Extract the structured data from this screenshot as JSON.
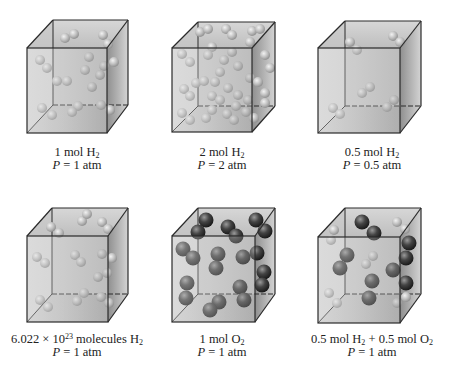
{
  "figure": {
    "colors": {
      "background": "#ffffff",
      "edge": "#2a2a2a",
      "h2_molecule": "#b8b8b8",
      "o2_molecule": "#3a3a3a"
    },
    "panels": [
      {
        "id": "p1",
        "amount": "1 mol H",
        "amount_sub": "2",
        "pressure_var": "P",
        "pressure_rest": " = 1 atm",
        "cube": {
          "bx": 53,
          "by": 20,
          "fx": 27,
          "fy": 48,
          "w": 80,
          "h": 85,
          "bw": 75
        },
        "molecules": [
          {
            "type": "H2",
            "x": 65,
            "y": 38
          },
          {
            "type": "H2",
            "x": 74,
            "y": 34
          },
          {
            "type": "H2",
            "x": 103,
            "y": 35
          },
          {
            "type": "H2",
            "x": 108,
            "y": 44
          },
          {
            "type": "H2",
            "x": 40,
            "y": 60
          },
          {
            "type": "H2",
            "x": 47,
            "y": 68
          },
          {
            "type": "H2",
            "x": 89,
            "y": 57
          },
          {
            "type": "H2",
            "x": 85,
            "y": 70
          },
          {
            "type": "H2",
            "x": 104,
            "y": 66
          },
          {
            "type": "H2",
            "x": 114,
            "y": 62
          },
          {
            "type": "H2",
            "x": 57,
            "y": 81
          },
          {
            "type": "H2",
            "x": 67,
            "y": 81
          },
          {
            "type": "H2",
            "x": 100,
            "y": 75
          },
          {
            "type": "H2",
            "x": 92,
            "y": 87
          },
          {
            "type": "H2",
            "x": 42,
            "y": 108
          },
          {
            "type": "H2",
            "x": 52,
            "y": 115
          },
          {
            "type": "H2",
            "x": 78,
            "y": 106
          },
          {
            "type": "H2",
            "x": 72,
            "y": 112
          },
          {
            "type": "H2",
            "x": 101,
            "y": 105
          },
          {
            "type": "H2",
            "x": 110,
            "y": 110
          }
        ]
      },
      {
        "id": "p2",
        "amount": "2 mol H",
        "amount_sub": "2",
        "pressure_var": "P",
        "pressure_rest": " = 2 atm",
        "cube": {
          "bx": 198,
          "by": 22,
          "fx": 172,
          "fy": 48,
          "w": 80,
          "h": 84,
          "bw": 77
        },
        "molecules": [
          {
            "type": "H2",
            "x": 200,
            "y": 32
          },
          {
            "type": "H2",
            "x": 208,
            "y": 29
          },
          {
            "type": "H2",
            "x": 226,
            "y": 29
          },
          {
            "type": "H2",
            "x": 232,
            "y": 35
          },
          {
            "type": "H2",
            "x": 252,
            "y": 31
          },
          {
            "type": "H2",
            "x": 260,
            "y": 29
          },
          {
            "type": "H2",
            "x": 212,
            "y": 47
          },
          {
            "type": "H2",
            "x": 250,
            "y": 42
          },
          {
            "type": "H2",
            "x": 182,
            "y": 54
          },
          {
            "type": "H2",
            "x": 190,
            "y": 62
          },
          {
            "type": "H2",
            "x": 208,
            "y": 55
          },
          {
            "type": "H2",
            "x": 224,
            "y": 60
          },
          {
            "type": "H2",
            "x": 232,
            "y": 52
          },
          {
            "type": "H2",
            "x": 265,
            "y": 55
          },
          {
            "type": "H2",
            "x": 270,
            "y": 68
          },
          {
            "type": "H2",
            "x": 220,
            "y": 72
          },
          {
            "type": "H2",
            "x": 238,
            "y": 66
          },
          {
            "type": "H2",
            "x": 250,
            "y": 78
          },
          {
            "type": "H2",
            "x": 196,
            "y": 83
          },
          {
            "type": "H2",
            "x": 204,
            "y": 81
          },
          {
            "type": "H2",
            "x": 215,
            "y": 82
          },
          {
            "type": "H2",
            "x": 228,
            "y": 88
          },
          {
            "type": "H2",
            "x": 258,
            "y": 82
          },
          {
            "type": "H2",
            "x": 265,
            "y": 93
          },
          {
            "type": "H2",
            "x": 184,
            "y": 89
          },
          {
            "type": "H2",
            "x": 190,
            "y": 96
          },
          {
            "type": "H2",
            "x": 212,
            "y": 96
          },
          {
            "type": "H2",
            "x": 220,
            "y": 100
          },
          {
            "type": "H2",
            "x": 238,
            "y": 95
          },
          {
            "type": "H2",
            "x": 248,
            "y": 100
          },
          {
            "type": "H2",
            "x": 265,
            "y": 103
          },
          {
            "type": "H2",
            "x": 182,
            "y": 113
          },
          {
            "type": "H2",
            "x": 190,
            "y": 120
          },
          {
            "type": "H2",
            "x": 212,
            "y": 110
          },
          {
            "type": "H2",
            "x": 206,
            "y": 118
          },
          {
            "type": "H2",
            "x": 227,
            "y": 114
          },
          {
            "type": "H2",
            "x": 234,
            "y": 120
          },
          {
            "type": "H2",
            "x": 246,
            "y": 112
          },
          {
            "type": "H2",
            "x": 254,
            "y": 118
          },
          {
            "type": "H2",
            "x": 236,
            "y": 106
          }
        ]
      },
      {
        "id": "p3",
        "amount": "0.5 mol H",
        "amount_sub": "2",
        "pressure_var": "P",
        "pressure_rest": " = 0.5 atm",
        "cube": {
          "bx": 345,
          "by": 21,
          "fx": 318,
          "fy": 48,
          "w": 82,
          "h": 85,
          "bw": 76
        },
        "molecules": [
          {
            "type": "H2",
            "x": 350,
            "y": 42
          },
          {
            "type": "H2",
            "x": 357,
            "y": 50
          },
          {
            "type": "H2",
            "x": 393,
            "y": 36
          },
          {
            "type": "H2",
            "x": 400,
            "y": 42
          },
          {
            "type": "H2",
            "x": 370,
            "y": 87
          },
          {
            "type": "H2",
            "x": 362,
            "y": 93
          },
          {
            "type": "H2",
            "x": 333,
            "y": 108
          },
          {
            "type": "H2",
            "x": 340,
            "y": 114
          },
          {
            "type": "H2",
            "x": 394,
            "y": 100
          },
          {
            "type": "H2",
            "x": 387,
            "y": 107
          }
        ]
      },
      {
        "id": "p4",
        "amount_pre": "6.022 × 10",
        "amount_sup": "23",
        "amount": " molecules H",
        "amount_sub": "2",
        "pressure_var": "P",
        "pressure_rest": " = 1 atm",
        "cube": {
          "bx": 52,
          "by": 208,
          "fx": 27,
          "fy": 236,
          "w": 81,
          "h": 86,
          "bw": 76
        },
        "molecules": [
          {
            "type": "H2",
            "x": 51,
            "y": 227
          },
          {
            "type": "H2",
            "x": 59,
            "y": 233
          },
          {
            "type": "H2",
            "x": 82,
            "y": 221
          },
          {
            "type": "H2",
            "x": 87,
            "y": 214
          },
          {
            "type": "H2",
            "x": 102,
            "y": 222
          },
          {
            "type": "H2",
            "x": 108,
            "y": 229
          },
          {
            "type": "H2",
            "x": 37,
            "y": 257
          },
          {
            "type": "H2",
            "x": 45,
            "y": 263
          },
          {
            "type": "H2",
            "x": 75,
            "y": 255
          },
          {
            "type": "H2",
            "x": 81,
            "y": 262
          },
          {
            "type": "H2",
            "x": 102,
            "y": 254
          },
          {
            "type": "H2",
            "x": 112,
            "y": 258
          },
          {
            "type": "H2",
            "x": 107,
            "y": 273
          },
          {
            "type": "H2",
            "x": 98,
            "y": 277
          },
          {
            "type": "H2",
            "x": 40,
            "y": 300
          },
          {
            "type": "H2",
            "x": 48,
            "y": 307
          },
          {
            "type": "H2",
            "x": 84,
            "y": 293
          },
          {
            "type": "H2",
            "x": 77,
            "y": 301
          },
          {
            "type": "H2",
            "x": 101,
            "y": 297
          },
          {
            "type": "H2",
            "x": 109,
            "y": 303
          }
        ]
      },
      {
        "id": "p5",
        "amount": "1 mol O",
        "amount_sub": "2",
        "pressure_var": "P",
        "pressure_rest": " = 1 atm",
        "cube": {
          "bx": 198,
          "by": 208,
          "fx": 172,
          "fy": 236,
          "w": 83,
          "h": 86,
          "bw": 77
        },
        "molecules": [
          {
            "type": "O2",
            "x": 206,
            "y": 220
          },
          {
            "type": "O2",
            "x": 198,
            "y": 232
          },
          {
            "type": "O2",
            "x": 228,
            "y": 227
          },
          {
            "type": "O2",
            "x": 236,
            "y": 236
          },
          {
            "type": "O2",
            "x": 256,
            "y": 220
          },
          {
            "type": "O2",
            "x": 265,
            "y": 231
          },
          {
            "type": "O2",
            "x": 183,
            "y": 249
          },
          {
            "type": "O2",
            "x": 193,
            "y": 258
          },
          {
            "type": "O2",
            "x": 218,
            "y": 254
          },
          {
            "type": "O2",
            "x": 216,
            "y": 268
          },
          {
            "type": "O2",
            "x": 243,
            "y": 257
          },
          {
            "type": "O2",
            "x": 257,
            "y": 253
          },
          {
            "type": "O2",
            "x": 264,
            "y": 272
          },
          {
            "type": "O2",
            "x": 262,
            "y": 285
          },
          {
            "type": "O2",
            "x": 187,
            "y": 283
          },
          {
            "type": "O2",
            "x": 186,
            "y": 298
          },
          {
            "type": "O2",
            "x": 219,
            "y": 302
          },
          {
            "type": "O2",
            "x": 210,
            "y": 310
          },
          {
            "type": "O2",
            "x": 240,
            "y": 287
          },
          {
            "type": "O2",
            "x": 244,
            "y": 300
          }
        ]
      },
      {
        "id": "p6",
        "amount": "0.5 mol H",
        "amount_sub": "2",
        "amount_mid": " + 0.5 mol O",
        "amount_sub2": "2",
        "pressure_var": "P",
        "pressure_rest": " = 1 atm",
        "cube": {
          "bx": 345,
          "by": 208,
          "fx": 318,
          "fy": 237,
          "w": 82,
          "h": 86,
          "bw": 76
        },
        "molecules": [
          {
            "type": "H2",
            "x": 334,
            "y": 230
          },
          {
            "type": "H2",
            "x": 331,
            "y": 240
          },
          {
            "type": "H2",
            "x": 397,
            "y": 222
          },
          {
            "type": "H2",
            "x": 405,
            "y": 229
          },
          {
            "type": "H2",
            "x": 373,
            "y": 256
          },
          {
            "type": "H2",
            "x": 366,
            "y": 264
          },
          {
            "type": "H2",
            "x": 329,
            "y": 293
          },
          {
            "type": "H2",
            "x": 337,
            "y": 303
          },
          {
            "type": "H2",
            "x": 397,
            "y": 303
          },
          {
            "type": "H2",
            "x": 406,
            "y": 297
          },
          {
            "type": "O2",
            "x": 362,
            "y": 222
          },
          {
            "type": "O2",
            "x": 374,
            "y": 233
          },
          {
            "type": "O2",
            "x": 409,
            "y": 243
          },
          {
            "type": "O2",
            "x": 406,
            "y": 258
          },
          {
            "type": "O2",
            "x": 347,
            "y": 255
          },
          {
            "type": "O2",
            "x": 340,
            "y": 268
          },
          {
            "type": "O2",
            "x": 393,
            "y": 270
          },
          {
            "type": "O2",
            "x": 406,
            "y": 283
          },
          {
            "type": "O2",
            "x": 372,
            "y": 281
          },
          {
            "type": "O2",
            "x": 369,
            "y": 298
          }
        ]
      }
    ],
    "caption_positions": [
      {
        "left": 2,
        "top": 146
      },
      {
        "left": 147,
        "top": 146
      },
      {
        "left": 297,
        "top": 146
      },
      {
        "left": 2,
        "top": 333
      },
      {
        "left": 147,
        "top": 333
      },
      {
        "left": 297,
        "top": 333
      }
    ]
  }
}
